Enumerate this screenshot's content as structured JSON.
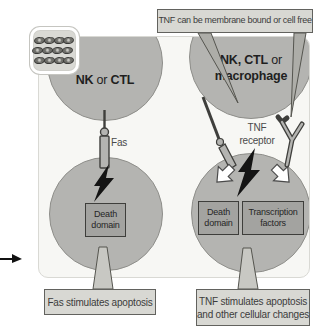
{
  "figure": {
    "title_context": "Fas and TNF apoptosis signalling diagram",
    "top_callout": "TNF can be membrane bound or cell free",
    "effector_left": {
      "bold1": "NK",
      "conj": " or ",
      "bold2": "CTL"
    },
    "effector_right": {
      "line1_bold": "NK, CTL",
      "line1_normal": " or",
      "line2_bold": "macrophage"
    },
    "fas_label": "Fas",
    "tnf_receptor_label": {
      "line1": "TNF",
      "line2": "receptor"
    },
    "target_left": {
      "box": "Death domain"
    },
    "target_right": {
      "box1": "Death domain",
      "box2": "Transcription factors"
    },
    "callout_fas": "Fas stimulates apoptosis",
    "callout_tnf": {
      "line1": "TNF stimulates apoptosis",
      "line2": "and other cellular changes"
    },
    "icons": {
      "granule_cluster": "granule-cluster-icon",
      "lightning_left": "lightning-bolt-icon",
      "lightning_right": "lightning-bolt-icon",
      "block_arrow_left": "block-arrow-down-left-icon",
      "block_arrow_right": "block-arrow-down-right-icon",
      "edge_arrow": "pointer-arrow-right-icon",
      "fas_receptor": "fas-receptor-icon",
      "membrane_tnf": "membrane-bound-tnf-icon",
      "y_receptor": "tnf-y-receptor-icon"
    }
  },
  "colors": {
    "panel-bg": "#f7f7f4",
    "panel-border": "#d9d9d4",
    "cell-fill": "#b4b4b1",
    "cell-edge": "#8e8e8a",
    "inner-box-fill": "#a3a3a0",
    "inner-box-edge": "#3e3e3b",
    "callout-fill": "#d8d8d3",
    "callout-edge": "#62625e",
    "icon-box-fill": "#d9d9d4",
    "pointer-top-fill": "#adada8",
    "pointer-bottom-fill": "#c8c8c3",
    "bolt-fill": "#141414",
    "arrow-white": "#ffffff"
  }
}
